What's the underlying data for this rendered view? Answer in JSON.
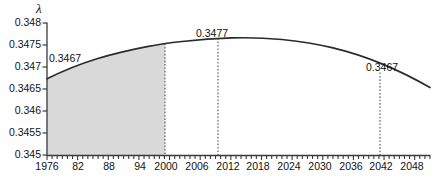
{
  "chart_data": {
    "type": "line",
    "title": "",
    "subtitle": "",
    "xlabel": "",
    "ylabel": "λ",
    "grid": false,
    "legend": null,
    "xlim": [
      1976,
      2051
    ],
    "ylim": [
      0.345,
      0.348
    ],
    "x_tick_labels": [
      "1976",
      "82",
      "88",
      "94",
      "2000",
      "2006",
      "2012",
      "2018",
      "2024",
      "2030",
      "2036",
      "2042",
      "2048"
    ],
    "x_tick_values": [
      1976,
      1982,
      1988,
      1994,
      2000,
      2006,
      2012,
      2018,
      2024,
      2030,
      2036,
      2042,
      2048
    ],
    "x_minor_tick_step": 1,
    "y_tick_labels": [
      "0.345",
      "0.3455",
      "0.346",
      "0.3465",
      "0.347",
      "0.3475",
      "0.348"
    ],
    "y_tick_values": [
      0.345,
      0.3455,
      0.346,
      0.3465,
      0.347,
      0.3475,
      0.348
    ],
    "series": [
      {
        "name": "lambda",
        "x": [
          1976,
          1980,
          1984,
          1988,
          1992,
          1996,
          1999,
          2002,
          2006,
          2010,
          2014,
          2018,
          2022,
          2026,
          2030,
          2034,
          2038,
          2042,
          2046,
          2051
        ],
        "values": [
          0.34665,
          0.34691,
          0.34712,
          0.34729,
          0.34744,
          0.34756,
          0.34763,
          0.34767,
          0.34771,
          0.34773,
          0.34774,
          0.34773,
          0.3477,
          0.34764,
          0.34755,
          0.34744,
          0.34729,
          0.34711,
          0.3469,
          0.34657
        ]
      }
    ],
    "shaded_region": {
      "x_start": 1976,
      "x_end": 1999,
      "fill": "#d9d9d9"
    },
    "markers": [
      {
        "label": "0.3467",
        "x": 1976,
        "value": 0.3467,
        "line": false
      },
      {
        "label": "0.3477",
        "x": 2008,
        "value": 0.3477,
        "line": true
      },
      {
        "label": "0.3467",
        "x": 2042,
        "value": 0.3467,
        "line": true
      }
    ],
    "reference_lines": [
      {
        "x": 1999
      },
      {
        "x": 2008
      },
      {
        "x": 2042
      }
    ],
    "colors": {
      "curve": "#2b2b2b",
      "shade": "#d9d9d9",
      "axis": "#3a3a3a",
      "dotted": "#555555",
      "background": "#ffffff"
    }
  }
}
